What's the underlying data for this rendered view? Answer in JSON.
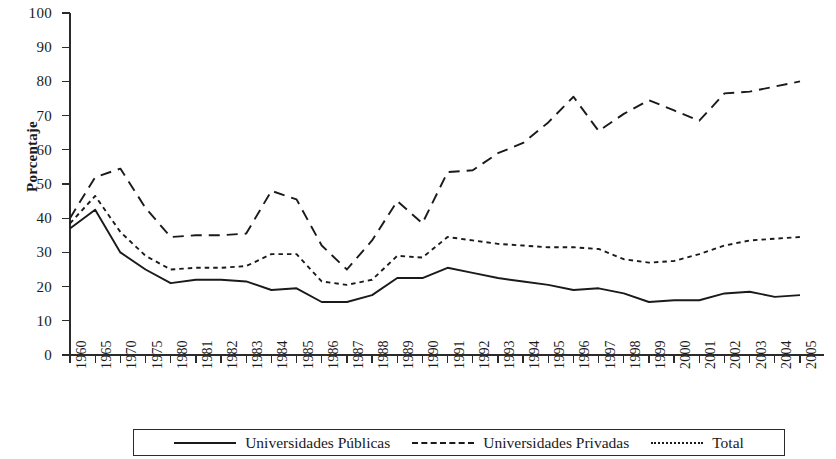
{
  "chart_data": {
    "type": "line",
    "title": "",
    "xlabel": "",
    "ylabel": "Porcentaje",
    "ylim": [
      0,
      100
    ],
    "ytick_step": 10,
    "yticks": [
      0,
      10,
      20,
      30,
      40,
      50,
      60,
      70,
      80,
      90,
      100
    ],
    "grid": false,
    "legend_position": "bottom",
    "categories": [
      "1960",
      "1965",
      "1970",
      "1975",
      "1980",
      "1981",
      "1982",
      "1983",
      "1984",
      "1985",
      "1986",
      "1987",
      "1988",
      "1989",
      "1990",
      "1991",
      "1992",
      "1993",
      "1994",
      "1995",
      "1996",
      "1997",
      "1998",
      "1999",
      "2000",
      "2001",
      "2002",
      "2003",
      "2004",
      "2005"
    ],
    "series": [
      {
        "name": "Universidades Públicas",
        "style": "solid",
        "color": "#1a1a1a",
        "values": [
          37,
          42.5,
          30,
          25,
          21,
          22,
          22,
          21.5,
          19,
          19.5,
          15.5,
          15.5,
          17.5,
          22.5,
          22.5,
          25.5,
          24,
          22.5,
          21.5,
          20.5,
          19,
          19.5,
          18,
          15.5,
          16,
          16,
          18,
          18.5,
          17,
          17.5
        ]
      },
      {
        "name": "Universidades Privadas",
        "style": "dashed",
        "color": "#1a1a1a",
        "values": [
          40,
          52,
          54.5,
          43,
          34.5,
          35,
          35,
          35.5,
          48,
          45.5,
          32,
          25,
          33.5,
          45,
          38.5,
          53.5,
          54,
          59,
          62,
          68,
          75.5,
          65.5,
          70.5,
          74.5,
          71.5,
          68.5,
          76.5,
          77,
          78.5,
          80
        ]
      },
      {
        "name": "Total",
        "style": "dotted",
        "color": "#1a1a1a",
        "values": [
          38.5,
          46.5,
          36,
          29,
          25,
          25.5,
          25.5,
          26,
          29.5,
          29.5,
          21.5,
          20.5,
          22,
          29,
          28.5,
          34.5,
          33.5,
          32.5,
          32,
          31.5,
          31.5,
          31,
          28,
          27,
          27.5,
          29.5,
          32,
          33.5,
          34,
          34.5
        ]
      }
    ]
  },
  "axis": {
    "y_label": "Porcentaje",
    "y_tick_labels": [
      "100",
      "90",
      "80",
      "70",
      "60",
      "50",
      "40",
      "30",
      "20",
      "10",
      "0"
    ]
  },
  "legend": {
    "entries": [
      {
        "label": "Universidades Públicas",
        "style": "solid"
      },
      {
        "label": "Universidades Privadas",
        "style": "dashed"
      },
      {
        "label": "Total",
        "style": "dotted"
      }
    ]
  }
}
